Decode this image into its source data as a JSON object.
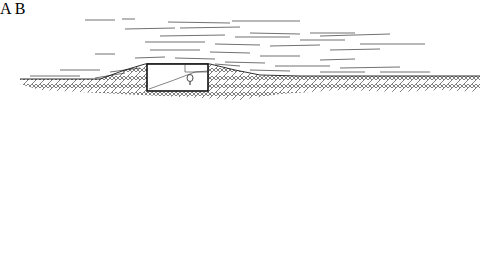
{
  "figure": {
    "panels": [
      {
        "id": "A",
        "label": "A",
        "description": "Single buried box structure under ground mound with wind/flow lines passing over",
        "ground_y": 79,
        "structure": {
          "x": 147,
          "y": 64,
          "width": 61,
          "height": 27,
          "has_lamp_icon": true
        }
      },
      {
        "id": "B",
        "label": "B",
        "description": "Two buried box structures connected by open courtyard with arched windows, wind lines above",
        "ground_y": 229,
        "structures": [
          {
            "x": 106,
            "y": 205,
            "width": 43,
            "height": 27
          },
          {
            "x": 208,
            "y": 205,
            "width": 43,
            "height": 27,
            "has_lamp_icon": true
          }
        ]
      }
    ],
    "colors": {
      "ink": "#1a1a1a",
      "background": "#ffffff"
    }
  }
}
